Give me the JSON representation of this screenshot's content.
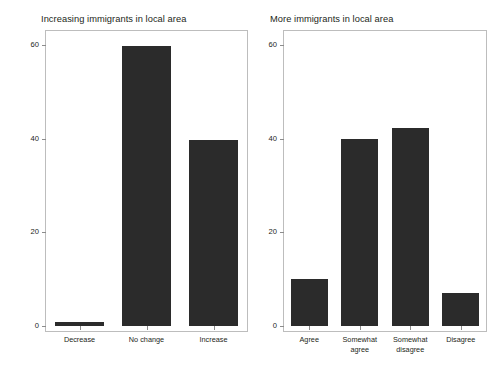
{
  "figure": {
    "ylabel": "Percentage of respondents",
    "y_ticks": [
      "0",
      "20",
      "40",
      "60"
    ]
  },
  "panels": [
    {
      "title": "Increasing immigrants in local area",
      "categories": [
        "Decrease",
        "No change",
        "Increase"
      ],
      "values": [
        0.8,
        59.7,
        39.8
      ]
    },
    {
      "title": "More immigrants in local area",
      "categories": [
        "Agree",
        "Somewhat agree",
        "Somewhat disagree",
        "Disagree"
      ],
      "categories_wrapped": [
        [
          "Agree"
        ],
        [
          "Somewhat",
          "agree"
        ],
        [
          "Somewhat",
          "disagree"
        ],
        [
          "Disagree"
        ]
      ],
      "values": [
        10.0,
        40.0,
        42.3,
        7.1
      ]
    }
  ],
  "chart_data": [
    {
      "type": "bar",
      "title": "Increasing immigrants in local area",
      "categories": [
        "Decrease",
        "No change",
        "Increase"
      ],
      "values": [
        0.8,
        59.7,
        39.8
      ],
      "xlabel": "",
      "ylabel": "Percentage of respondents",
      "ylim": [
        0,
        63
      ],
      "yticks": [
        0,
        20,
        40,
        60
      ],
      "grid": false,
      "legend": "none",
      "bar_color": "#2b2b2b"
    },
    {
      "type": "bar",
      "title": "More immigrants in local area",
      "categories": [
        "Agree",
        "Somewhat agree",
        "Somewhat disagree",
        "Disagree"
      ],
      "values": [
        10.0,
        40.0,
        42.3,
        7.1
      ],
      "xlabel": "",
      "ylabel": "Percentage of respondents",
      "ylim": [
        0,
        63
      ],
      "yticks": [
        0,
        20,
        40,
        60
      ],
      "grid": false,
      "legend": "none",
      "bar_color": "#2b2b2b"
    }
  ]
}
